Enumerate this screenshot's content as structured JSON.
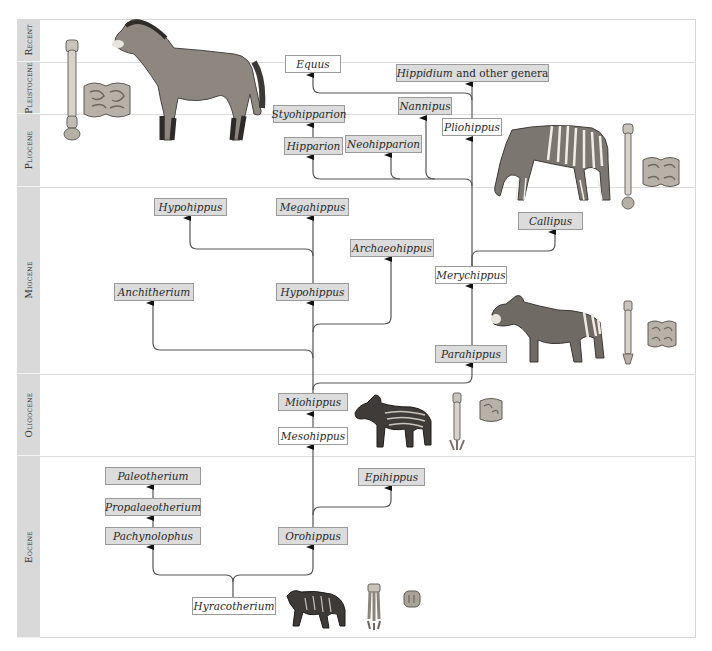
{
  "periods": [
    {
      "label": "Recent",
      "top": 19,
      "height": 43
    },
    {
      "label": "Pleistocene",
      "top": 62,
      "height": 52
    },
    {
      "label": "Pliocene",
      "top": 114,
      "height": 73
    },
    {
      "label": "Miocene",
      "top": 187,
      "height": 187
    },
    {
      "label": "Oligocene",
      "top": 374,
      "height": 82
    },
    {
      "label": "Eocene",
      "top": 456,
      "height": 182
    }
  ],
  "taxa": {
    "equus": {
      "label": "Equus",
      "style": "white"
    },
    "hippidium": {
      "label": "Hippidium",
      "suffix": " and other genera",
      "style": "grey"
    },
    "styohipparion": {
      "label": "Styohipparion",
      "style": "grey"
    },
    "nannipus": {
      "label": "Nannipus",
      "style": "grey"
    },
    "pliohippus": {
      "label": "Pliohippus",
      "style": "white"
    },
    "hipparion": {
      "label": "Hipparion",
      "style": "grey"
    },
    "neohipparion": {
      "label": "Neohipparion",
      "style": "grey"
    },
    "hypohippus_upper": {
      "label": "Hypohippus",
      "style": "grey"
    },
    "megahippus": {
      "label": "Megahippus",
      "style": "grey"
    },
    "callipus": {
      "label": "Callipus",
      "style": "grey"
    },
    "archaeohippus": {
      "label": "Archaeohippus",
      "style": "grey"
    },
    "merychippus": {
      "label": "Merychippus",
      "style": "white"
    },
    "anchitherium": {
      "label": "Anchitherium",
      "style": "grey"
    },
    "hypohippus_lower": {
      "label": "Hypohippus",
      "style": "grey"
    },
    "parahippus": {
      "label": "Parahippus",
      "style": "grey"
    },
    "miohippus": {
      "label": "Miohippus",
      "style": "grey"
    },
    "mesohippus": {
      "label": "Mesohippus",
      "style": "white"
    },
    "paleotherium": {
      "label": "Paleotherium",
      "style": "grey"
    },
    "propalaeotherium": {
      "label": "Propalaeotherium",
      "style": "grey"
    },
    "epihippus": {
      "label": "Epihippus",
      "style": "grey"
    },
    "pachynolophus": {
      "label": "Pachynolophus",
      "style": "grey"
    },
    "orohippus": {
      "label": "Orohippus",
      "style": "grey"
    },
    "hyracotherium": {
      "label": "Hyracotherium",
      "style": "white"
    }
  },
  "illustrations": [
    {
      "name": "modern-horse-equus",
      "period": "Recent/Pleistocene"
    },
    {
      "name": "equus-foot-bone",
      "period": "Recent/Pleistocene"
    },
    {
      "name": "equus-molar-tooth",
      "period": "Pleistocene"
    },
    {
      "name": "pliohippus-grazing-horse",
      "period": "Pliocene"
    },
    {
      "name": "pliohippus-foot-bone",
      "period": "Pliocene"
    },
    {
      "name": "pliohippus-molar-tooth",
      "period": "Pliocene"
    },
    {
      "name": "merychippus-horse",
      "period": "Miocene"
    },
    {
      "name": "merychippus-foot-bone",
      "period": "Miocene"
    },
    {
      "name": "merychippus-molar-tooth",
      "period": "Miocene"
    },
    {
      "name": "mesohippus-horse",
      "period": "Oligocene"
    },
    {
      "name": "mesohippus-foot-bone",
      "period": "Oligocene"
    },
    {
      "name": "mesohippus-molar-tooth",
      "period": "Oligocene"
    },
    {
      "name": "hyracotherium-animal",
      "period": "Eocene"
    },
    {
      "name": "hyracotherium-foot-bone",
      "period": "Eocene"
    },
    {
      "name": "hyracotherium-molar-tooth",
      "period": "Eocene"
    }
  ],
  "colors": {
    "period_column": "#d9d9d9",
    "grey_box": "#dcdcdc",
    "white_box": "#ffffff",
    "box_border": "#9a9a9a",
    "link_line": "#555555"
  }
}
